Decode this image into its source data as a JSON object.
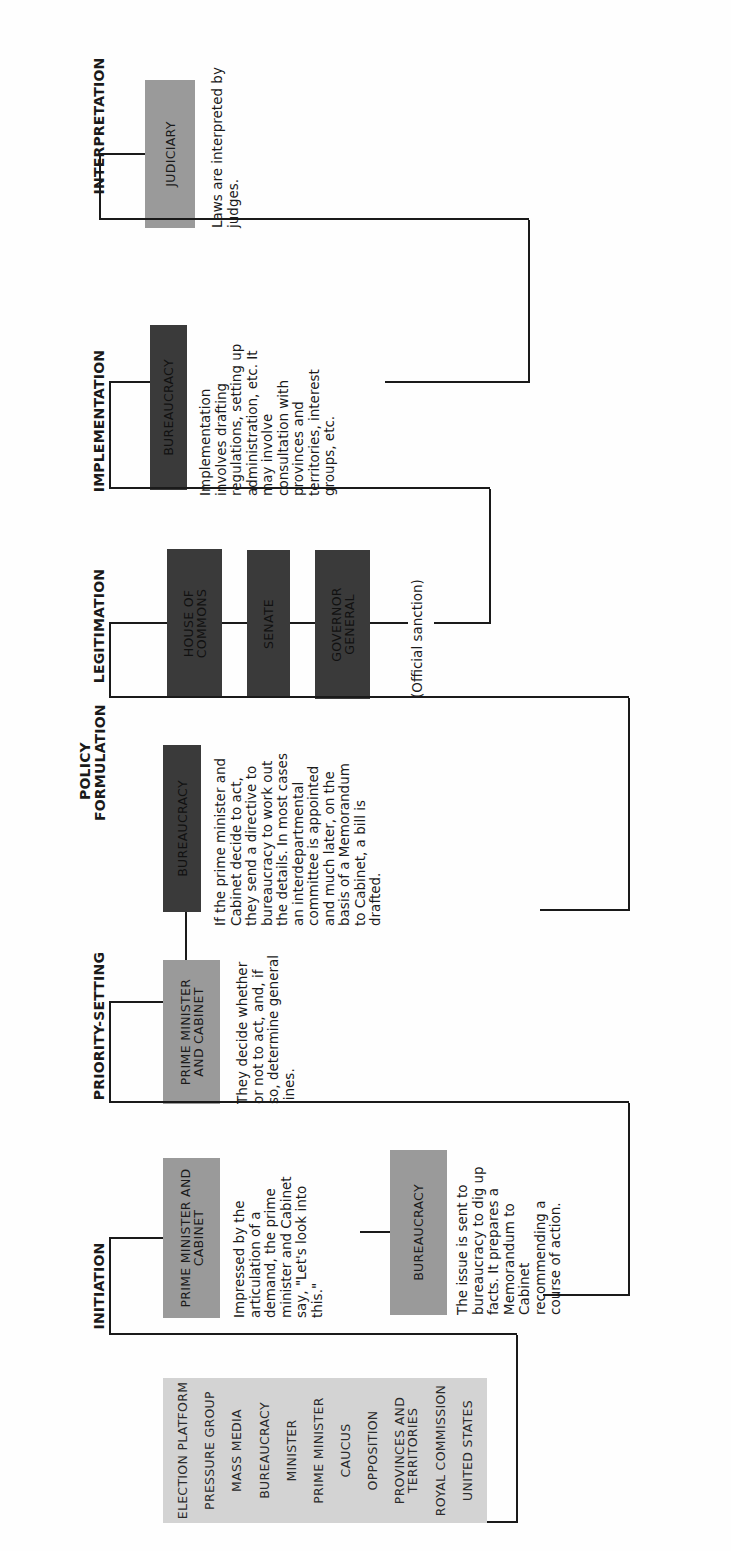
{
  "stages": [
    {
      "id": "initiation",
      "label": "INITIATION"
    },
    {
      "id": "priority",
      "label": "PRIORITY-SETTING"
    },
    {
      "id": "policy",
      "label": "POLICY FORMULATION"
    },
    {
      "id": "legitimation",
      "label": "LEGITIMATION"
    },
    {
      "id": "implementation",
      "label": "IMPLEMENTATION"
    },
    {
      "id": "interpretation",
      "label": "INTERPRETATION"
    }
  ],
  "sources": [
    "ELECTION PLATFORM",
    "PRESSURE GROUP",
    "MASS MEDIA",
    "BUREAUCRACY",
    "MINISTER",
    "PRIME MINISTER",
    "CAUCUS",
    "OPPOSITION",
    "PROVINCES AND TERRITORIES",
    "ROYAL COMMISSION",
    "UNITED STATES"
  ],
  "initiation": {
    "pmc_label": "PRIME MINISTER AND CABINET",
    "pmc_desc": "Impressed by the articulation of a demand, the prime minister and Cabinet say, \"Let's look into this.\"",
    "bureau_label": "BUREAUCRACY",
    "bureau_desc": "The issue is sent to bureaucracy to dig up facts. It prepares a Memorandum to Cabinet recommending a course of action."
  },
  "priority": {
    "pmc_label": "PRIME MINISTER AND CABINET",
    "pmc_desc": "They decide whether or not to act, and, if so, determine general lines."
  },
  "policy": {
    "bureau_label": "BUREAUCRACY",
    "bureau_desc": "If the prime minister and Cabinet decide to act, they send a directive to bureaucracy to work out the details. In most cases an interdepartmental committee is appointed and much later, on the basis of a Memorandum to Cabinet, a bill is drafted."
  },
  "legitimation": {
    "hoc_label": "HOUSE OF COMMONS",
    "senate_label": "SENATE",
    "gg_label": "GOVERNOR GENERAL",
    "note": "(Official sanction)"
  },
  "implementation": {
    "bureau_label": "BUREAUCRACY",
    "bureau_desc": "Implementation involves drafting regulations, setting up administration, etc. It may involve consultation with provinces and territories, interest groups, etc."
  },
  "interpretation": {
    "judiciary_label": "JUDICIARY",
    "judiciary_desc": "Laws are interpreted by judges."
  },
  "colors": {
    "light_box": "#cdcdcd",
    "mid_box": "#9a9a9a",
    "dark_box": "#3a3a3a",
    "line": "#1a1a1a"
  }
}
